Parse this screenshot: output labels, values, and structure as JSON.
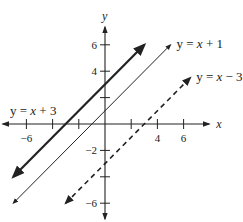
{
  "chart_data": {
    "type": "line",
    "title": "",
    "xlabel": "x",
    "ylabel": "y",
    "xlim": [
      -7.8,
      7.8
    ],
    "ylim": [
      -7.2,
      7.2
    ],
    "grid": false,
    "x_ticks": [
      -6,
      -4,
      -2,
      2,
      4,
      6
    ],
    "x_tick_labels": [
      "-6",
      "4",
      "6"
    ],
    "x_tick_label_values": [
      -6,
      4,
      6
    ],
    "y_ticks": [
      -6,
      -4,
      -2,
      2,
      4,
      6
    ],
    "y_tick_labels": [
      "6",
      "4",
      "-2",
      "-6"
    ],
    "y_tick_label_values": [
      6,
      4,
      -2,
      -6
    ],
    "series": [
      {
        "name": "y = x + 3",
        "slope": 1,
        "intercept": 3,
        "x_range": [
          -7,
          3
        ],
        "style": "solid-thick",
        "arrows": "both"
      },
      {
        "name": "y = x + 1",
        "slope": 1,
        "intercept": 1,
        "x_range": [
          -7,
          5
        ],
        "style": "solid-thin",
        "arrows": "both"
      },
      {
        "name": "y = x − 3",
        "slope": 1,
        "intercept": -3,
        "x_range": [
          -3,
          6.5
        ],
        "style": "dashed",
        "arrows": "both"
      }
    ],
    "labels": [
      {
        "text": "y = x + 3",
        "series": 0,
        "anchor": "left-of-line"
      },
      {
        "text": "y = x + 1",
        "series": 1,
        "anchor": "right-end"
      },
      {
        "text": "y = x − 3",
        "series": 2,
        "anchor": "right-end"
      }
    ]
  }
}
